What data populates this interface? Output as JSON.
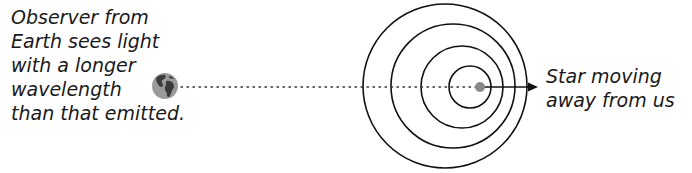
{
  "diagram": {
    "observer_caption": {
      "lines": [
        "Observer from",
        "Earth sees light",
        "with a longer",
        "wavelength",
        "than that emitted."
      ]
    },
    "star_caption": {
      "lines": [
        "Star moving",
        "away from us"
      ]
    },
    "icons": {
      "earth": "earth-globe-icon",
      "star": "star-dot-icon",
      "arrow": "arrow-right-icon"
    },
    "colors": {
      "text": "#1a1a1a",
      "lines": "#111111",
      "earth_ocean": "#9a9a9a",
      "earth_land": "#3a3a3a",
      "star": "#888888"
    },
    "wavefronts": [
      {
        "cx": 445,
        "cy": 86,
        "r": 82
      },
      {
        "cx": 453,
        "cy": 86,
        "r": 62
      },
      {
        "cx": 462,
        "cy": 87,
        "r": 41
      },
      {
        "cx": 470,
        "cy": 87,
        "r": 21
      }
    ]
  }
}
